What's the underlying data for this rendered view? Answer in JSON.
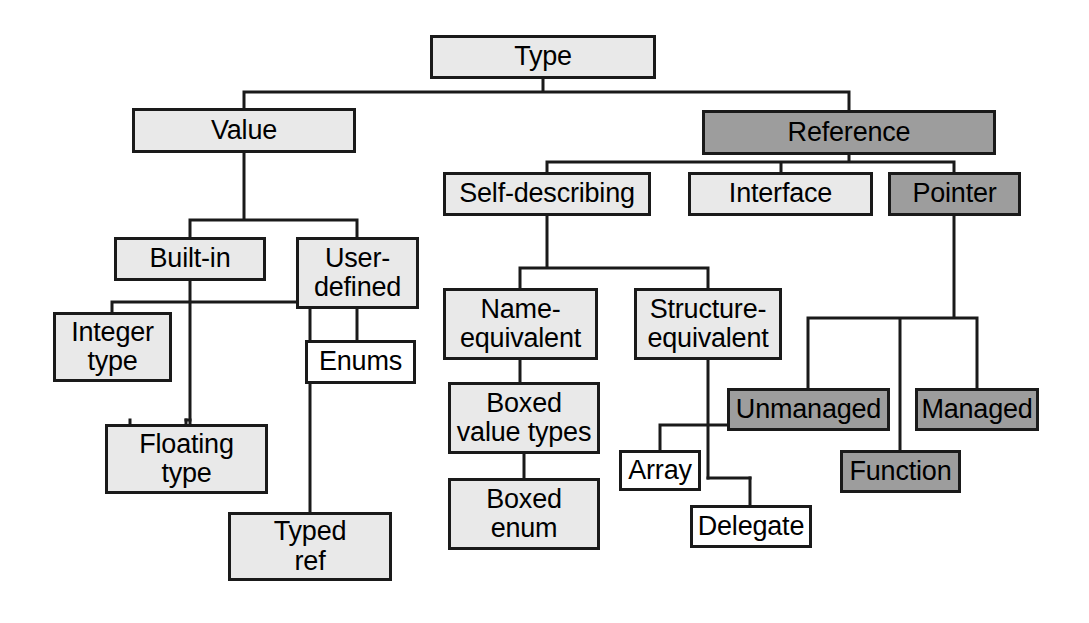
{
  "diagram": {
    "colors": {
      "light_fill": "#e9e9e9",
      "white_fill": "#ffffff",
      "dark_fill": "#9d9d9d",
      "stroke": "#1a1a1a",
      "background": "#ffffff"
    },
    "nodes": [
      {
        "id": "type",
        "label": "Type",
        "fill": "light",
        "x": 430,
        "y": 35,
        "w": 226,
        "h": 44
      },
      {
        "id": "value",
        "label": "Value",
        "fill": "light",
        "x": 132,
        "y": 108,
        "w": 224,
        "h": 45
      },
      {
        "id": "reference",
        "label": "Reference",
        "fill": "dark",
        "x": 702,
        "y": 110,
        "w": 294,
        "h": 45
      },
      {
        "id": "self-describing",
        "label": "Self-describing",
        "fill": "light",
        "x": 443,
        "y": 172,
        "w": 208,
        "h": 44
      },
      {
        "id": "interface",
        "label": "Interface",
        "fill": "light",
        "x": 688,
        "y": 172,
        "w": 185,
        "h": 44
      },
      {
        "id": "pointer",
        "label": "Pointer",
        "fill": "dark",
        "x": 888,
        "y": 172,
        "w": 133,
        "h": 44
      },
      {
        "id": "built-in",
        "label": "Built-in",
        "fill": "light",
        "x": 114,
        "y": 237,
        "w": 152,
        "h": 44
      },
      {
        "id": "user-defined",
        "label": "User-\ndefined",
        "fill": "light",
        "x": 296,
        "y": 237,
        "w": 123,
        "h": 72
      },
      {
        "id": "name-equivalent",
        "label": "Name-\nequivalent",
        "fill": "light",
        "x": 443,
        "y": 288,
        "w": 155,
        "h": 72
      },
      {
        "id": "structure-equivalent",
        "label": "Structure-\nequivalent",
        "fill": "light",
        "x": 634,
        "y": 288,
        "w": 148,
        "h": 72
      },
      {
        "id": "integer-type",
        "label": "Integer\ntype",
        "fill": "light",
        "x": 53,
        "y": 312,
        "w": 119,
        "h": 70
      },
      {
        "id": "enums",
        "label": "Enums",
        "fill": "white",
        "x": 305,
        "y": 340,
        "w": 111,
        "h": 44
      },
      {
        "id": "boxed-value-types",
        "label": "Boxed\nvalue types",
        "fill": "light",
        "x": 448,
        "y": 382,
        "w": 152,
        "h": 72
      },
      {
        "id": "unmanaged",
        "label": "Unmanaged",
        "fill": "dark",
        "x": 727,
        "y": 388,
        "w": 163,
        "h": 43
      },
      {
        "id": "managed",
        "label": "Managed",
        "fill": "dark",
        "x": 915,
        "y": 388,
        "w": 124,
        "h": 43
      },
      {
        "id": "floating-type",
        "label": "Floating\ntype",
        "fill": "light",
        "x": 105,
        "y": 424,
        "w": 163,
        "h": 70
      },
      {
        "id": "array",
        "label": "Array",
        "fill": "white",
        "x": 619,
        "y": 450,
        "w": 82,
        "h": 41
      },
      {
        "id": "function",
        "label": "Function",
        "fill": "dark",
        "x": 840,
        "y": 450,
        "w": 121,
        "h": 43
      },
      {
        "id": "boxed-enum",
        "label": "Boxed\nenum",
        "fill": "light",
        "x": 448,
        "y": 478,
        "w": 152,
        "h": 72
      },
      {
        "id": "delegate",
        "label": "Delegate",
        "fill": "white",
        "x": 690,
        "y": 505,
        "w": 122,
        "h": 43
      },
      {
        "id": "typed-ref",
        "label": "Typed\nref",
        "fill": "light",
        "x": 228,
        "y": 512,
        "w": 164,
        "h": 69
      }
    ],
    "edges": [
      {
        "from": "type",
        "to": "value"
      },
      {
        "from": "type",
        "to": "reference"
      },
      {
        "from": "value",
        "to": "built-in"
      },
      {
        "from": "value",
        "to": "user-defined"
      },
      {
        "from": "reference",
        "to": "self-describing"
      },
      {
        "from": "reference",
        "to": "interface"
      },
      {
        "from": "reference",
        "to": "pointer"
      },
      {
        "from": "built-in",
        "to": "integer-type"
      },
      {
        "from": "built-in",
        "to": "floating-type"
      },
      {
        "from": "built-in",
        "to": "typed-ref"
      },
      {
        "from": "user-defined",
        "to": "enums"
      },
      {
        "from": "self-describing",
        "to": "name-equivalent"
      },
      {
        "from": "self-describing",
        "to": "structure-equivalent"
      },
      {
        "from": "name-equivalent",
        "to": "boxed-value-types"
      },
      {
        "from": "boxed-value-types",
        "to": "boxed-enum"
      },
      {
        "from": "structure-equivalent",
        "to": "array"
      },
      {
        "from": "structure-equivalent",
        "to": "delegate"
      },
      {
        "from": "pointer",
        "to": "unmanaged"
      },
      {
        "from": "pointer",
        "to": "function"
      },
      {
        "from": "pointer",
        "to": "managed"
      }
    ]
  }
}
